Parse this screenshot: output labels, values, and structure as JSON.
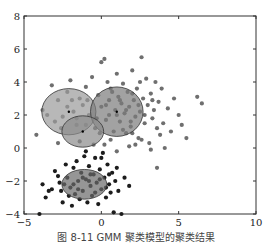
{
  "caption": "图 8-11 GMM 聚类模型的聚类结果",
  "chart_data": {
    "type": "scatter",
    "title": "",
    "xlabel": "",
    "ylabel": "",
    "xlim": [
      -5,
      10
    ],
    "ylim": [
      -4,
      8
    ],
    "xticks": [
      -5,
      0,
      5,
      10
    ],
    "yticks": [
      -4,
      -2,
      0,
      2,
      4,
      6,
      8
    ],
    "grid": false,
    "legend": null,
    "series": [
      {
        "name": "cluster-upper",
        "color": "#6f6f6f",
        "points": [
          [
            -4.2,
            0.8
          ],
          [
            -3.8,
            2.3
          ],
          [
            -3.2,
            3.8
          ],
          [
            -2.8,
            2.9
          ],
          [
            -2.5,
            1.9
          ],
          [
            -2.2,
            3.4
          ],
          [
            -2.0,
            4.1
          ],
          [
            -1.8,
            2.2
          ],
          [
            -1.6,
            1.4
          ],
          [
            -1.4,
            3.0
          ],
          [
            -1.2,
            2.6
          ],
          [
            -1.0,
            3.7
          ],
          [
            -0.8,
            2.0
          ],
          [
            -0.6,
            4.3
          ],
          [
            -0.4,
            1.2
          ],
          [
            -0.2,
            3.2
          ],
          [
            0.0,
            2.5
          ],
          [
            0.0,
            5.2
          ],
          [
            0.2,
            5.4
          ],
          [
            0.3,
            1.7
          ],
          [
            0.4,
            4.0
          ],
          [
            0.5,
            2.9
          ],
          [
            0.6,
            3.6
          ],
          [
            0.8,
            1.0
          ],
          [
            0.9,
            2.3
          ],
          [
            1.0,
            4.5
          ],
          [
            1.1,
            3.1
          ],
          [
            1.2,
            1.6
          ],
          [
            1.3,
            2.7
          ],
          [
            1.4,
            3.9
          ],
          [
            1.5,
            2.1
          ],
          [
            1.6,
            0.9
          ],
          [
            1.7,
            3.4
          ],
          [
            1.8,
            2.5
          ],
          [
            1.9,
            1.3
          ],
          [
            2.0,
            4.7
          ],
          [
            2.1,
            2.9
          ],
          [
            2.2,
            1.9
          ],
          [
            2.3,
            3.6
          ],
          [
            2.4,
            0.6
          ],
          [
            2.5,
            2.2
          ],
          [
            2.6,
            5.5
          ],
          [
            2.7,
            3.0
          ],
          [
            2.8,
            1.5
          ],
          [
            2.9,
            4.2
          ],
          [
            3.0,
            2.6
          ],
          [
            3.1,
            0.3
          ],
          [
            3.2,
            3.3
          ],
          [
            3.3,
            1.8
          ],
          [
            3.4,
            2.3
          ],
          [
            3.5,
            4.0
          ],
          [
            3.6,
            1.2
          ],
          [
            3.7,
            2.8
          ],
          [
            3.8,
            0.8
          ],
          [
            3.9,
            3.6
          ],
          [
            4.0,
            1.5
          ],
          [
            4.1,
            0.0
          ],
          [
            4.3,
            2.4
          ],
          [
            4.5,
            1.0
          ],
          [
            4.7,
            3.0
          ],
          [
            5.0,
            2.0
          ],
          [
            5.2,
            1.4
          ],
          [
            5.5,
            0.6
          ],
          [
            6.2,
            3.1
          ],
          [
            6.5,
            2.7
          ],
          [
            3.6,
            -1.2
          ],
          [
            2.2,
            0.2
          ],
          [
            1.0,
            -0.2
          ],
          [
            -0.5,
            0.2
          ],
          [
            0.6,
            0.5
          ],
          [
            -2.8,
            0.3
          ],
          [
            -1.4,
            0.4
          ],
          [
            1.8,
            0.1
          ],
          [
            2.6,
            0.5
          ],
          [
            3.2,
            -0.1
          ],
          [
            -0.1,
            0.9
          ],
          [
            1.4,
            1.1
          ],
          [
            0.2,
            0.2
          ],
          [
            2.0,
            0.9
          ],
          [
            -1.0,
            1.4
          ],
          [
            0.5,
            2.0
          ],
          [
            1.0,
            2.0
          ],
          [
            1.6,
            2.3
          ],
          [
            2.4,
            2.6
          ],
          [
            1.2,
            2.9
          ],
          [
            2.0,
            3.3
          ],
          [
            0.7,
            3.4
          ],
          [
            1.9,
            1.6
          ],
          [
            2.8,
            2.0
          ],
          [
            0.3,
            2.6
          ],
          [
            -2.2,
            2.5
          ],
          [
            -3.0,
            1.6
          ],
          [
            -1.6,
            1.8
          ],
          [
            -2.6,
            1.2
          ],
          [
            -0.9,
            2.9
          ],
          [
            -1.9,
            2.9
          ],
          [
            -3.5,
            2.0
          ],
          [
            -0.3,
            1.8
          ],
          [
            2.5,
            4.0
          ],
          [
            3.3,
            2.9
          ]
        ]
      },
      {
        "name": "cluster-lower",
        "color": "#1c1c1c",
        "points": [
          [
            -4.0,
            -4.0
          ],
          [
            -3.8,
            -2.2
          ],
          [
            -3.6,
            -3.0
          ],
          [
            -3.4,
            -2.6
          ],
          [
            -3.2,
            -2.5
          ],
          [
            -3.0,
            -1.4
          ],
          [
            -2.8,
            -1.7
          ],
          [
            -2.6,
            -2.6
          ],
          [
            -2.5,
            -3.3
          ],
          [
            -2.4,
            -2.2
          ],
          [
            -2.2,
            -1.8
          ],
          [
            -2.0,
            -2.4
          ],
          [
            -1.9,
            -3.5
          ],
          [
            -1.8,
            -1.2
          ],
          [
            -1.7,
            -2.8
          ],
          [
            -1.6,
            -0.8
          ],
          [
            -1.5,
            -2.0
          ],
          [
            -1.4,
            -3.1
          ],
          [
            -1.3,
            -1.5
          ],
          [
            -1.2,
            -2.6
          ],
          [
            -1.1,
            -0.5
          ],
          [
            -1.0,
            -1.9
          ],
          [
            -0.9,
            -3.3
          ],
          [
            -0.8,
            -1.1
          ],
          [
            -0.7,
            -2.3
          ],
          [
            -0.6,
            -2.9
          ],
          [
            -0.5,
            -1.6
          ],
          [
            -0.4,
            -0.6
          ],
          [
            -0.3,
            -2.1
          ],
          [
            -0.2,
            -3.4
          ],
          [
            -0.1,
            -1.3
          ],
          [
            0.0,
            -2.5
          ],
          [
            0.1,
            -0.3
          ],
          [
            0.2,
            -1.8
          ],
          [
            0.3,
            -3.0
          ],
          [
            0.4,
            -1.0
          ],
          [
            0.5,
            -2.2
          ],
          [
            0.6,
            -2.7
          ],
          [
            0.7,
            -1.5
          ],
          [
            0.8,
            -3.9
          ],
          [
            0.9,
            -2.0
          ],
          [
            1.0,
            -1.2
          ],
          [
            1.1,
            -2.6
          ],
          [
            1.3,
            -4.0
          ],
          [
            1.5,
            -1.8
          ],
          [
            1.8,
            -2.3
          ],
          [
            -2.3,
            -1.0
          ],
          [
            -1.0,
            -0.2
          ],
          [
            0.0,
            -0.6
          ],
          [
            -0.7,
            -1.6
          ],
          [
            -1.5,
            -2.5
          ],
          [
            -0.4,
            -2.7
          ],
          [
            -1.2,
            -1.8
          ],
          [
            0.3,
            -2.4
          ],
          [
            -2.1,
            -2.9
          ],
          [
            -2.7,
            -2.1
          ],
          [
            -0.8,
            -2.0
          ],
          [
            0.5,
            -1.6
          ],
          [
            -1.8,
            -2.2
          ],
          [
            -0.1,
            -1.9
          ]
        ]
      }
    ],
    "ellipses": [
      {
        "cx": -2.1,
        "cy": 2.2,
        "rx": 1.75,
        "ry": 1.4,
        "fill": "#9a9a9a",
        "center_mark": true
      },
      {
        "cx": 1.0,
        "cy": 2.2,
        "rx": 1.7,
        "ry": 1.5,
        "fill": "#7a7a7a",
        "center_mark": true
      },
      {
        "cx": -1.2,
        "cy": 1.0,
        "rx": 1.35,
        "ry": 0.95,
        "fill": "#8a8a8a",
        "center_mark": true
      },
      {
        "cx": -1.1,
        "cy": -2.2,
        "rx": 1.45,
        "ry": 0.9,
        "fill": "#6a6a6a",
        "center_mark": false
      }
    ]
  }
}
